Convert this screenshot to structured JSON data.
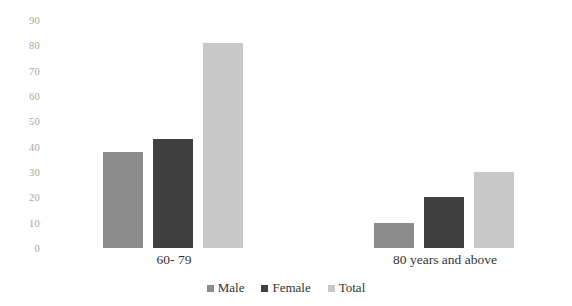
{
  "chart_data": {
    "type": "bar",
    "title": "",
    "xlabel": "",
    "ylabel": "",
    "categories": [
      "60- 79",
      "80 years and above"
    ],
    "series": [
      {
        "name": "Male",
        "values": [
          38,
          10
        ],
        "color": "#8c8c8c"
      },
      {
        "name": "Female",
        "values": [
          43,
          20
        ],
        "color": "#404040"
      },
      {
        "name": "Total",
        "values": [
          81,
          30
        ],
        "color": "#c8c8c8"
      }
    ],
    "ylim": [
      0,
      90
    ],
    "y_ticks": [
      0,
      10,
      20,
      30,
      40,
      50,
      60,
      70,
      80,
      90
    ],
    "y_tick_labels": [
      "0",
      "10",
      "20",
      "30",
      "40",
      "50",
      "60",
      "70",
      "80",
      "90"
    ],
    "grid": false,
    "legend_position": "bottom"
  },
  "axis": {
    "tick_0": "0",
    "tick_1": "10",
    "tick_2": "20",
    "tick_3": "30",
    "tick_4": "40",
    "tick_5": "50",
    "tick_6": "60",
    "tick_7": "70",
    "tick_8": "80",
    "tick_9": "90"
  },
  "categories": {
    "group_0": "60- 79",
    "group_1": "80 years and above"
  },
  "legend": {
    "items": [
      {
        "label": "Male",
        "color": "#8c8c8c"
      },
      {
        "label": "Female",
        "color": "#404040"
      },
      {
        "label": "Total",
        "color": "#c8c8c8"
      }
    ]
  },
  "colors": {
    "male": "#8c8c8c",
    "female": "#404040",
    "total": "#c8c8c8",
    "axis_text": "#a6a6a6",
    "label_text": "#333333",
    "background": "#ffffff"
  }
}
